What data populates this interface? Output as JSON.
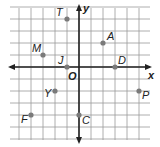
{
  "chart_data": {
    "type": "scatter",
    "title": "",
    "xlabel": "x",
    "ylabel": "y",
    "origin_label": "O",
    "xlim": [
      -6,
      6
    ],
    "ylim": [
      -6,
      5
    ],
    "grid": true,
    "points": [
      {
        "label": "T",
        "x": -1,
        "y": 4
      },
      {
        "label": "A",
        "x": 2,
        "y": 2
      },
      {
        "label": "M",
        "x": -3,
        "y": 1
      },
      {
        "label": "J",
        "x": -1,
        "y": 0
      },
      {
        "label": "D",
        "x": 3,
        "y": 0
      },
      {
        "label": "Y",
        "x": -2,
        "y": -2
      },
      {
        "label": "P",
        "x": 5,
        "y": -2
      },
      {
        "label": "F",
        "x": -4,
        "y": -4
      },
      {
        "label": "C",
        "x": 0,
        "y": -4
      }
    ]
  },
  "colors": {
    "grid": "#9a9a9a",
    "axis": "#222222",
    "point": "#7a7a7a",
    "label": "#222222"
  }
}
